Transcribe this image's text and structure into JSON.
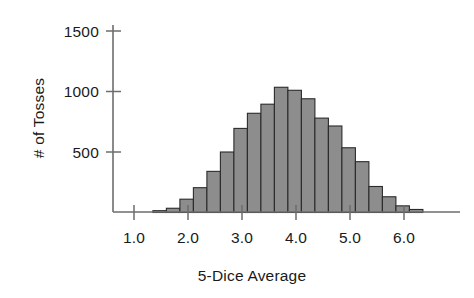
{
  "chart_data": {
    "type": "bar",
    "title": "",
    "subtitle": "",
    "xlabel": "5-Dice Average",
    "ylabel": "# of Tosses",
    "xlim": [
      0.85,
      6.45
    ],
    "ylim": [
      0,
      1600
    ],
    "grid": false,
    "legend": null,
    "bin_width": 0.25,
    "x_ticks": [
      {
        "value": 1.0,
        "label": "1.0"
      },
      {
        "value": 2.0,
        "label": "2.0"
      },
      {
        "value": 3.0,
        "label": "3.0"
      },
      {
        "value": 4.0,
        "label": "4.0"
      },
      {
        "value": 5.0,
        "label": "5.0"
      },
      {
        "value": 6.0,
        "label": "6.0"
      }
    ],
    "y_ticks": [
      {
        "value": 500,
        "label": "500"
      },
      {
        "value": 1000,
        "label": "1000"
      },
      {
        "value": 1500,
        "label": "1500"
      }
    ],
    "bins": [
      {
        "start": 1.35,
        "end": 1.6,
        "center": 1.475,
        "value": 15
      },
      {
        "start": 1.6,
        "end": 1.85,
        "center": 1.725,
        "value": 35
      },
      {
        "start": 1.85,
        "end": 2.1,
        "center": 1.975,
        "value": 110
      },
      {
        "start": 2.1,
        "end": 2.35,
        "center": 2.225,
        "value": 205
      },
      {
        "start": 2.35,
        "end": 2.6,
        "center": 2.475,
        "value": 340
      },
      {
        "start": 2.6,
        "end": 2.85,
        "center": 2.725,
        "value": 500
      },
      {
        "start": 2.85,
        "end": 3.1,
        "center": 2.975,
        "value": 695
      },
      {
        "start": 3.1,
        "end": 3.35,
        "center": 3.225,
        "value": 820
      },
      {
        "start": 3.35,
        "end": 3.6,
        "center": 3.475,
        "value": 895
      },
      {
        "start": 3.6,
        "end": 3.85,
        "center": 3.725,
        "value": 1035
      },
      {
        "start": 3.85,
        "end": 4.1,
        "center": 3.975,
        "value": 1010
      },
      {
        "start": 4.1,
        "end": 4.35,
        "center": 4.225,
        "value": 940
      },
      {
        "start": 4.35,
        "end": 4.6,
        "center": 4.475,
        "value": 780
      },
      {
        "start": 4.6,
        "end": 4.85,
        "center": 4.725,
        "value": 715
      },
      {
        "start": 4.85,
        "end": 5.1,
        "center": 4.975,
        "value": 535
      },
      {
        "start": 5.1,
        "end": 5.35,
        "center": 5.225,
        "value": 420
      },
      {
        "start": 5.35,
        "end": 5.6,
        "center": 5.475,
        "value": 215
      },
      {
        "start": 5.6,
        "end": 5.85,
        "center": 5.725,
        "value": 130
      },
      {
        "start": 5.85,
        "end": 6.1,
        "center": 5.975,
        "value": 55
      },
      {
        "start": 6.1,
        "end": 6.35,
        "center": 6.225,
        "value": 25
      }
    ],
    "colors": {
      "bar_fill": "#8d8d8d",
      "bar_stroke": "#2b2b2b",
      "axis": "#6d6d6d",
      "text": "#1a1a1a",
      "background": "#ffffff"
    }
  }
}
